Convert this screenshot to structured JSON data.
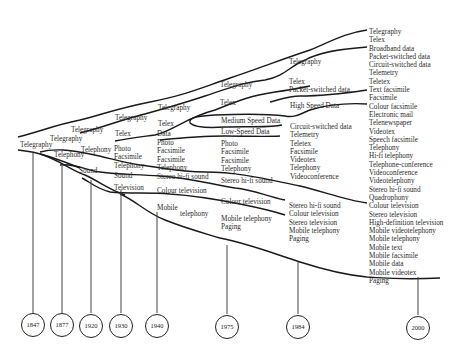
{
  "diagram": {
    "years": [
      "1847",
      "1877",
      "1920",
      "1930",
      "1940",
      "1975",
      "1984",
      "2000"
    ],
    "labels": {
      "start_telegraphy": "Telegraphy",
      "b1_telegraphy": "Telegraphy",
      "b1_telephony": "Telephony",
      "b2_telegraphy": "Telegraphy",
      "b2_telex": "Telex",
      "b2_telephony": "Telephony",
      "b2_sound": "Sound",
      "c_telegraphy": "Telegraphy",
      "c_telex": "Telex",
      "c_data": "Data",
      "c_stack": [
        "Photo",
        "Facsimile",
        "Telephony"
      ],
      "c_sound": "Sound",
      "c_television": "Television",
      "d_telegraphy": "Telegraphy",
      "d_telex": "Telex",
      "d_medium": "Medium Speed Data",
      "d_low": "Low-Speed Data",
      "d_stack": [
        "Photo",
        "Facsimile",
        "Facsimile",
        "Telephony"
      ],
      "d_stereo": "Stereo hi-fi sound",
      "d_colour": "Colour television",
      "d_mobile": "Mobile",
      "d_mobile2": "telephony",
      "e_stack1": [
        "Photo",
        "Facsimile",
        "Facsimile",
        "Telephony"
      ],
      "e_stereo": "Stereo hi-fi sound",
      "e_colour": "Colour television",
      "e_mobile": [
        "Mobile telephony",
        "Paging"
      ],
      "f_telegraphy": "Telegraphy",
      "f_telex": [
        "Telex",
        "Packet-switched data"
      ],
      "f_high": "High Speed Data",
      "f_circuit": [
        "Circuit-switched data",
        "Telemetry",
        "Teletex",
        "Facsimile",
        "Videotex",
        "Telephony",
        "Videoconference"
      ],
      "f_av": [
        "Stereo hi-fi sound",
        "Colour television",
        "Stereo television",
        "Mobile telephony",
        "Paging"
      ],
      "final": [
        "Telegraphy",
        "Telex",
        "Broadband data",
        "Packet-switched data",
        "Circuit-switched data",
        "Telemetry",
        "Teletex",
        "Text facsimile",
        "Facsimile",
        "Colour facsimile",
        "Electronic mail",
        "Telenewspaper",
        "Videotex",
        "Speech facsimile",
        "Telephony",
        "Hi-fi telephony",
        "Telephone-conference",
        "Videoconference",
        "Videotelephony",
        "Stereo hi-fi sound",
        "Quadrophony",
        "Colour television",
        "Stereo television",
        "High-definition television",
        "Mobile videotelephony",
        "Mobile telephony",
        "Mobile text",
        "Mobile facsimile",
        "Mobile data",
        "Mobile videotex",
        "Paging"
      ]
    }
  }
}
